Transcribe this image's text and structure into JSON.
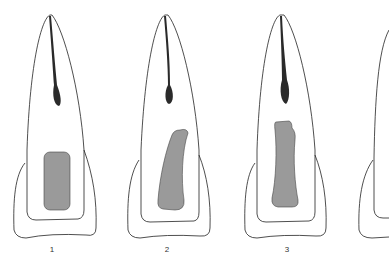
{
  "figure": {
    "panels": [
      {
        "label": "1",
        "x": 52,
        "y": 245
      },
      {
        "label": "2",
        "x": 167,
        "y": 245
      },
      {
        "label": "3",
        "x": 287,
        "y": 245
      }
    ],
    "colors": {
      "outline": "#222222",
      "canal": "#2a2a2a",
      "filling": "#9a9a9a",
      "background": "#ffffff"
    }
  }
}
